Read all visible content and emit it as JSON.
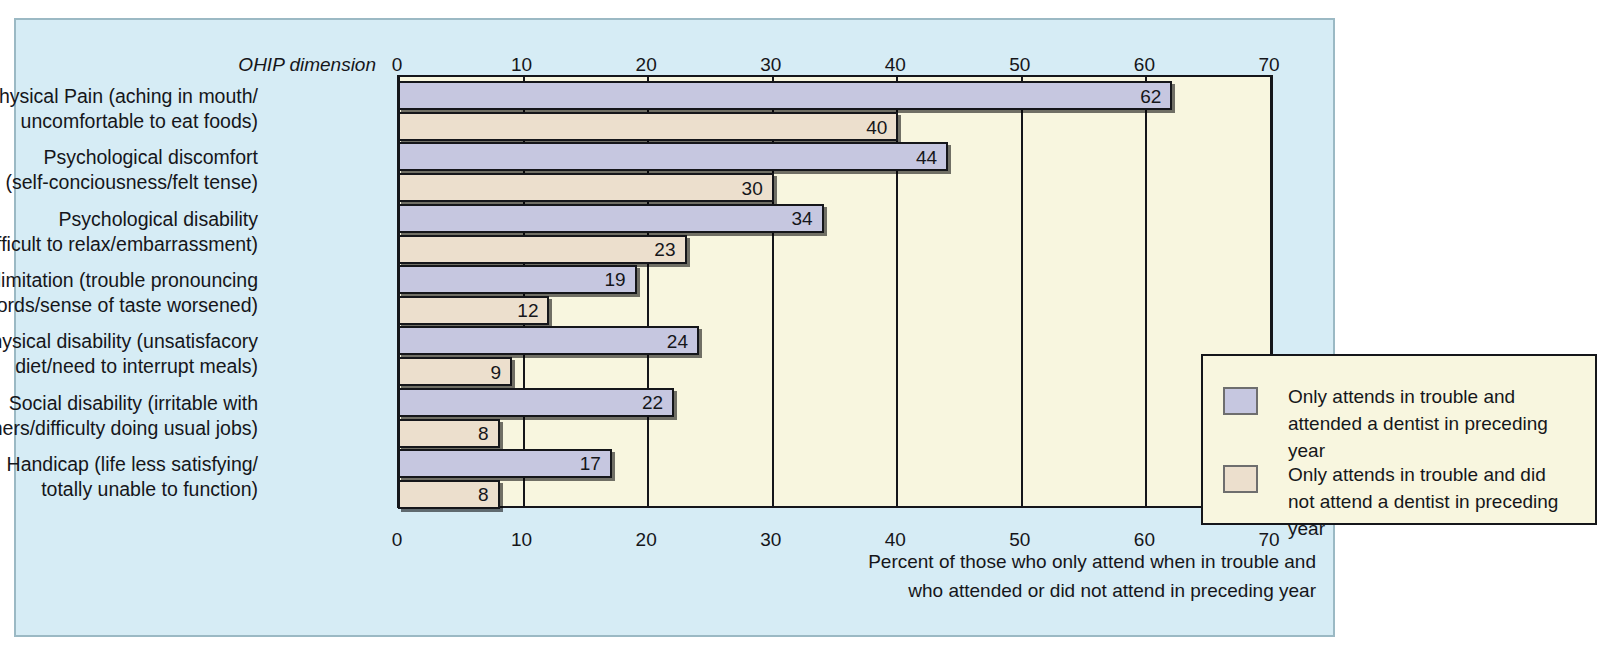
{
  "axis_title": "OHIP dimension",
  "caption": "Percent of those who only attend when in trouble and\nwho attended or did not attend in preceding year",
  "colors": {
    "background": "#d6ecf5",
    "plot_background": "#f8f6df",
    "series_attended": "#c6c7e0",
    "series_not_attended": "#ecdfcd",
    "line": "#15161a"
  },
  "legend": {
    "items": [
      {
        "label": "Only attends in trouble and\nattended a dentist in preceding year",
        "color": "#c6c7e0"
      },
      {
        "label": "Only attends in trouble and did\nnot attend a dentist in preceding year",
        "color": "#ecdfcd"
      }
    ]
  },
  "chart_data": {
    "type": "bar",
    "orientation": "horizontal",
    "title": "",
    "xlabel": "Percent of those who only attend when in trouble and who attended or did not attend in preceding year",
    "ylabel": "OHIP dimension",
    "xlim": [
      0,
      70
    ],
    "xticks": [
      0,
      10,
      20,
      30,
      40,
      50,
      60,
      70
    ],
    "grid": true,
    "legend_position": "inside-right",
    "categories": [
      "Physical Pain (aching in mouth/\nuncomfortable to eat foods)",
      "Psychological discomfort\n(self-conciousness/felt tense)",
      "Psychological disability\n(difficult to relax/embarrassment)",
      "Functional limitation (trouble pronouncing\nwords/sense of taste worsened)",
      "Physical disability (unsatisfacory\ndiet/need to interrupt meals)",
      "Social disability (irritable with\nothers/difficulty doing usual jobs)",
      "Handicap (life less satisfying/\ntotally unable to function)"
    ],
    "series": [
      {
        "name": "Only attends in trouble and attended a dentist in preceding year",
        "color": "#c6c7e0",
        "values": [
          62,
          44,
          34,
          19,
          24,
          22,
          17
        ]
      },
      {
        "name": "Only attends in trouble and did not attend a dentist in preceding year",
        "color": "#ecdfcd",
        "values": [
          40,
          30,
          23,
          12,
          9,
          8,
          8
        ]
      }
    ]
  }
}
